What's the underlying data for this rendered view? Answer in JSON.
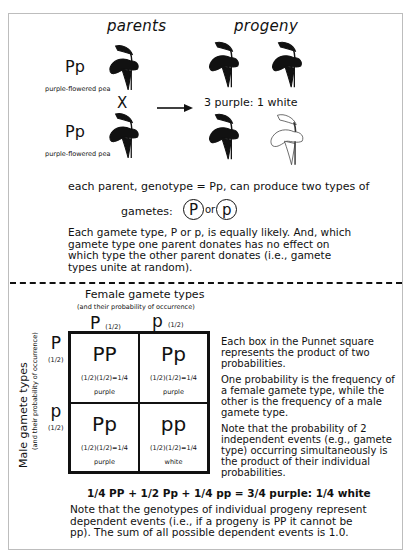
{
  "headings": {
    "parents": "parents",
    "progeny": "progeny"
  },
  "parents": [
    {
      "genotype": "Pp",
      "label": "purple-flowered pea"
    },
    {
      "genotype": "Pp",
      "label": "purple-flowered pea"
    }
  ],
  "cross_symbol": "X",
  "arrow_icon": "right-arrow",
  "progeny_ratio": "3 purple: 1 white",
  "progeny_plants": [
    {
      "color": "purple"
    },
    {
      "color": "purple"
    },
    {
      "color": "purple"
    },
    {
      "color": "white"
    }
  ],
  "gametes_intro": "each parent, genotype = Pp, can produce two types of",
  "gametes_label": "gametes:",
  "gamete_circles": [
    "P",
    "p"
  ],
  "gamete_or": "or",
  "equal_likelihood": "Each gamete type, P or p, is equally likely.  And, which gamete type one parent donates has no effect on which type the other parent donates (i.e., gamete types unite at random).",
  "punnett": {
    "female_title": "Female gamete types",
    "female_subtitle": "(and their probability of occurrence)",
    "male_title": "Male gamete types",
    "male_subtitle": "(and their probability of occurrence)",
    "columns": [
      {
        "allele": "P",
        "prob": "(1/2)"
      },
      {
        "allele": "p",
        "prob": "(1/2)"
      }
    ],
    "rows": [
      {
        "allele": "P",
        "prob": "(1/2)"
      },
      {
        "allele": "p",
        "prob": "(1/2)"
      }
    ],
    "cells": [
      {
        "genotype": "PP",
        "calc": "(1/2)(1/2)=1/4",
        "phenotype": "purple"
      },
      {
        "genotype": "Pp",
        "calc": "(1/2)(1/2)=1/4",
        "phenotype": "purple"
      },
      {
        "genotype": "Pp",
        "calc": "(1/2)(1/2)=1/4",
        "phenotype": "purple"
      },
      {
        "genotype": "pp",
        "calc": "(1/2)(1/2)=1/4",
        "phenotype": "white"
      }
    ]
  },
  "side_notes": [
    "Each box in the Punnet square represents the product of two probabilities.",
    "One probability is the frequency of a female gamete type, while the other is the frequency of a male gamete type.",
    "Note that the probability of 2 independent events (e.g., gamete type) occurring simultaneously is the product of their individual probabilities."
  ],
  "equation": "1/4 PP + 1/2 Pp + 1/4 pp =  3/4 purple: 1/4 white",
  "final_note": "Note that the genotypes of individual progeny represent dependent events (i.e., if a progeny is PP it cannot be pp). The sum of all possible dependent events is 1.0."
}
